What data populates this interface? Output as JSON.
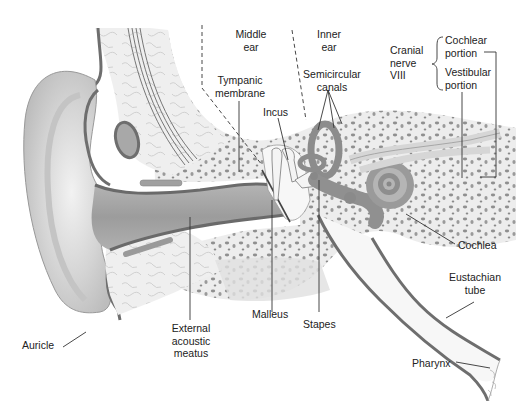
{
  "figure": {
    "colors": {
      "skin": "#e4e4e4",
      "skin_shadow": "#b9b9b9",
      "cartilage_outline": "#6e6e6e",
      "bone": "#ececec",
      "bone_pores": "#8c8c8c",
      "canal": "#9a9a9a",
      "membranous_labyrinth": "#909090",
      "leader_line": "#333333",
      "text": "#222222"
    }
  },
  "labels": {
    "middle_ear": [
      "Middle",
      "ear"
    ],
    "inner_ear": [
      "Inner",
      "ear"
    ],
    "cranial_nerve": [
      "Cranial",
      "nerve",
      "VIII"
    ],
    "cochlear_portion": [
      "Cochlear",
      "portion"
    ],
    "vestibular_portion": [
      "Vestibular",
      "portion"
    ],
    "tympanic_membrane": [
      "Tympanic",
      "membrane"
    ],
    "semicircular_canals": [
      "Semicircular",
      "canals"
    ],
    "incus": "Incus",
    "cochlea": "Cochlea",
    "eustachian_tube": [
      "Eustachian",
      "tube"
    ],
    "malleus": "Malleus",
    "stapes": "Stapes",
    "external_acoustic_meatus": [
      "External",
      "acoustic",
      "meatus"
    ],
    "auricle": "Auricle",
    "pharynx": "Pharynx"
  }
}
